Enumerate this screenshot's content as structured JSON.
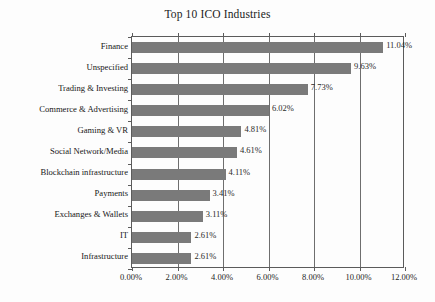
{
  "chart_data": {
    "type": "bar",
    "orientation": "horizontal",
    "title": "Top 10 ICO Industries",
    "xlabel": "",
    "ylabel": "",
    "xlim": [
      0,
      12
    ],
    "grid": true,
    "legend": null,
    "categories": [
      "Finance",
      "Unspecified",
      "Trading & Investing",
      "Commerce & Advertising",
      "Gaming & VR",
      "Social Network/Media",
      "Blockchain infrastructure",
      "Payments",
      "Exchanges & Wallets",
      "IT",
      "Infrastructure"
    ],
    "values": [
      11.04,
      9.63,
      7.73,
      6.02,
      4.81,
      4.61,
      4.11,
      3.41,
      3.11,
      2.61,
      2.61
    ],
    "value_labels": [
      "11.04%",
      "9.63%",
      "7.73%",
      "6.02%",
      "4.81%",
      "4.61%",
      "4.11%",
      "3.41%",
      "3.11%",
      "2.61%",
      "2.61%"
    ],
    "xticks": [
      0,
      2,
      4,
      6,
      8,
      10,
      12
    ],
    "xtick_labels": [
      "0.00%",
      "2.00%",
      "4.00%",
      "6.00%",
      "8.00%",
      "10.00%",
      "12.00%"
    ],
    "bar_color": "#7a7a7a",
    "axis_color": "#5b5b5b",
    "background": "#fdfdfd"
  }
}
